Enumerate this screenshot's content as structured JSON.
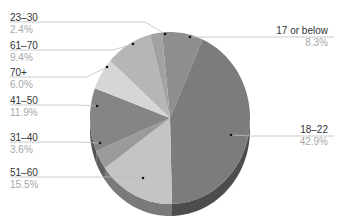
{
  "chart_data": {
    "type": "pie",
    "style": "3d",
    "title": "",
    "categories": [
      "17 or below",
      "18–22",
      "51–60",
      "31–40",
      "41–50",
      "70+",
      "61–70",
      "23–30"
    ],
    "values": [
      8.3,
      42.9,
      15.5,
      3.6,
      11.9,
      6.0,
      9.4,
      2.4
    ],
    "value_labels": [
      "8.3%",
      "42.9%",
      "15.5%",
      "3.6%",
      "11.9%",
      "6.0%",
      "9.4%",
      "2.4%"
    ],
    "colors": [
      "#8e8e8e",
      "#7c7c7c",
      "#c4c4c4",
      "#9a9a9a",
      "#858585",
      "#d6d6d6",
      "#b6b6b6",
      "#a2a2a2"
    ],
    "legend": "none (callout labels)",
    "grid": false
  },
  "labels": [
    {
      "name": "23–30",
      "pct": "2.4%"
    },
    {
      "name": "61–70",
      "pct": "9.4%"
    },
    {
      "name": "70+",
      "pct": "6.0%"
    },
    {
      "name": "41–50",
      "pct": "11.9%"
    },
    {
      "name": "31–40",
      "pct": "3.6%"
    },
    {
      "name": "51–60",
      "pct": "15.5%"
    },
    {
      "name": "17 or below",
      "pct": "8.3%"
    },
    {
      "name": "18–22",
      "pct": "42.9%"
    }
  ]
}
